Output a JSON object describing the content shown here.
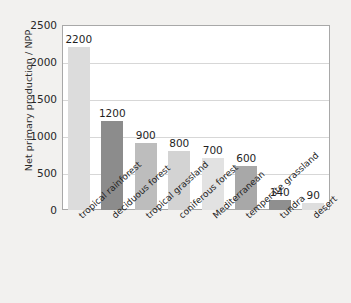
{
  "chart_data": {
    "type": "bar",
    "title": "",
    "xlabel": "",
    "ylabel": "Net primary production / NPP",
    "ylim": [
      0,
      2500
    ],
    "yticks": [
      0,
      500,
      1000,
      1500,
      2000,
      2500
    ],
    "ytick_labels": [
      "0",
      "500",
      "1000",
      "1500",
      "2000",
      "2500"
    ],
    "grid": true,
    "legend": "none",
    "categories": [
      "tropical rainforest",
      "deciduous forest",
      "tropical grassland",
      "coniferous forest",
      "Mediterranean",
      "temperate grassland",
      "tundra",
      "desert"
    ],
    "values": [
      2200,
      1200,
      900,
      800,
      700,
      600,
      140,
      90
    ],
    "value_labels": [
      "2200",
      "1200",
      "900",
      "800",
      "700",
      "600",
      "140",
      "90"
    ],
    "bar_colors": [
      "#dcdcdc",
      "#8c8c8c",
      "#bdbdbd",
      "#d3d3d3",
      "#e2e2e2",
      "#a8a8a8",
      "#8f8f8f",
      "#dedede"
    ]
  },
  "colors": {
    "page_background": "#f2f1ef",
    "plot_background": "#ffffff",
    "axis_line": "#a8a8a8",
    "gridline": "#d7d7d7",
    "text": "#242424"
  }
}
